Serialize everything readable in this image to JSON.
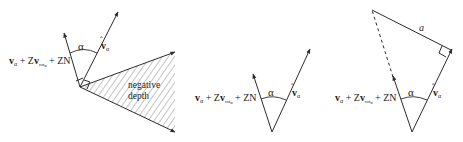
{
  "diagrams": [
    {
      "id": "left",
      "expression": {
        "v": "v",
        "v_sub": "α",
        "plus1": " + Z",
        "v2": "v",
        "v2_sub": "rot",
        "v2_subsub": "α",
        "plus2": " + ZN"
      },
      "angle_label": "α",
      "vhat_label": "v",
      "vhat_sub": "α",
      "region_label_line1": "negative",
      "region_label_line2": "depth"
    },
    {
      "id": "middle",
      "expression": {
        "v": "v",
        "v_sub": "α",
        "plus1": " + Z",
        "v2": "v",
        "v2_sub": "rot",
        "v2_subsub": "α",
        "plus2": " + ZN"
      },
      "angle_label": "α",
      "vhat_label": "v",
      "vhat_sub": "α"
    },
    {
      "id": "right",
      "expression": {
        "v": "v",
        "v_sub": "α",
        "plus1": " + Z",
        "v2": "v",
        "v2_sub": "rot",
        "v2_subsub": "α",
        "plus2": " + ZN"
      },
      "angle_label": "α",
      "vhat_label": "v",
      "vhat_sub": "α",
      "side_label": "a"
    }
  ]
}
